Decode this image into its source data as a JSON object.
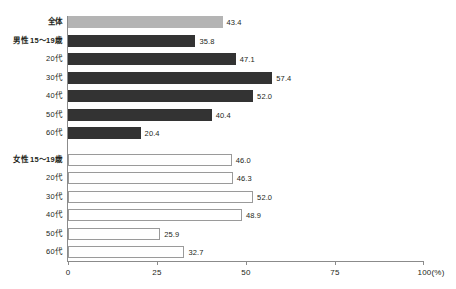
{
  "chart_data": {
    "type": "bar",
    "orientation": "horizontal",
    "title": "",
    "xlabel": "(%)",
    "ylabel": "",
    "xlim": [
      0,
      100
    ],
    "grid": false,
    "legend": "none",
    "xticks": [
      {
        "value": 0,
        "label": "0"
      },
      {
        "value": 25,
        "label": "25"
      },
      {
        "value": 50,
        "label": "50"
      },
      {
        "value": 75,
        "label": "75"
      },
      {
        "value": 100,
        "label": "100(%)"
      }
    ],
    "categories": [
      "全体",
      "男性 15～19歳",
      "20代",
      "30代",
      "40代",
      "50代",
      "60代",
      "女性 15～19歳",
      "20代",
      "30代",
      "40代",
      "50代",
      "60代"
    ],
    "values": [
      43.4,
      35.8,
      47.1,
      57.4,
      52.0,
      40.4,
      20.4,
      46.0,
      46.3,
      52.0,
      48.9,
      25.9,
      32.7
    ],
    "bars": [
      {
        "label": "全体",
        "value": 43.4,
        "value_label": "43.4",
        "style": "total",
        "group": true,
        "gap_before": false
      },
      {
        "label": "男性 15～19歳",
        "value": 35.8,
        "value_label": "35.8",
        "style": "male",
        "group": true,
        "gap_before": false
      },
      {
        "label": "20代",
        "value": 47.1,
        "value_label": "47.1",
        "style": "male",
        "group": false,
        "gap_before": false
      },
      {
        "label": "30代",
        "value": 57.4,
        "value_label": "57.4",
        "style": "male",
        "group": false,
        "gap_before": false
      },
      {
        "label": "40代",
        "value": 52.0,
        "value_label": "52.0",
        "style": "male",
        "group": false,
        "gap_before": false
      },
      {
        "label": "50代",
        "value": 40.4,
        "value_label": "40.4",
        "style": "male",
        "group": false,
        "gap_before": false
      },
      {
        "label": "60代",
        "value": 20.4,
        "value_label": "20.4",
        "style": "male",
        "group": false,
        "gap_before": false
      },
      {
        "label": "女性 15～19歳",
        "value": 46.0,
        "value_label": "46.0",
        "style": "female",
        "group": true,
        "gap_before": true
      },
      {
        "label": "20代",
        "value": 46.3,
        "value_label": "46.3",
        "style": "female",
        "group": false,
        "gap_before": false
      },
      {
        "label": "30代",
        "value": 52.0,
        "value_label": "52.0",
        "style": "female",
        "group": false,
        "gap_before": false
      },
      {
        "label": "40代",
        "value": 48.9,
        "value_label": "48.9",
        "style": "female",
        "group": false,
        "gap_before": false
      },
      {
        "label": "50代",
        "value": 25.9,
        "value_label": "25.9",
        "style": "female",
        "group": false,
        "gap_before": false
      },
      {
        "label": "60代",
        "value": 32.7,
        "value_label": "32.7",
        "style": "female",
        "group": false,
        "gap_before": false
      }
    ],
    "colors": {
      "total_bar": "#b4b4b4",
      "male_bar": "#333333",
      "female_bar_fill": "#ffffff",
      "female_bar_stroke": "#9a9a9a",
      "axis": "#8b8b8b",
      "text": "#231f20"
    }
  }
}
